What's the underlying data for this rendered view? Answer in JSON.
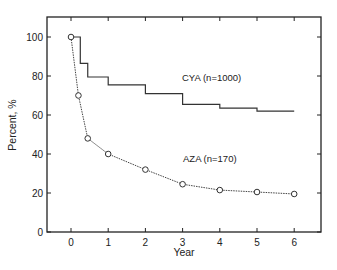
{
  "chart_data": {
    "type": "line",
    "title": "",
    "xlabel": "Year",
    "ylabel": "Percent, %",
    "xlim": [
      -0.65,
      6.75
    ],
    "ylim": [
      0,
      110
    ],
    "x_ticks": [
      0,
      1,
      2,
      3,
      4,
      5,
      6
    ],
    "y_ticks": [
      0,
      20,
      40,
      60,
      80,
      100
    ],
    "grid": false,
    "legend": "inline labels",
    "series": [
      {
        "name": "CYA (n=1000)",
        "style": "step, solid",
        "x": [
          0,
          0.25,
          0.45,
          1,
          2,
          3,
          4,
          5,
          6
        ],
        "values": [
          100,
          86.5,
          79.5,
          75.5,
          71,
          65.5,
          63.5,
          62,
          62
        ]
      },
      {
        "name": "AZA (n=170)",
        "style": "dotted line with open circle markers",
        "x": [
          0,
          0.2,
          0.45,
          1,
          2,
          3,
          4,
          5,
          6
        ],
        "values": [
          100,
          70,
          48,
          40,
          32,
          24.5,
          21.5,
          20.5,
          19.5
        ]
      }
    ],
    "annotations": [
      {
        "text": "CYA (n=1000)",
        "x": 3.05,
        "y": 79
      },
      {
        "text": "AZA (n=170)",
        "x": 3.0,
        "y": 38
      }
    ]
  },
  "labels": {
    "xlabel": "Year",
    "ylabel": "Percent, %",
    "cya": "CYA (n=1000)",
    "aza": "AZA (n=170)"
  }
}
